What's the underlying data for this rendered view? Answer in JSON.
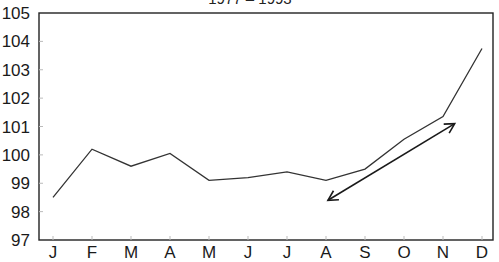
{
  "chart_data": {
    "type": "line",
    "title": "1977 – 1993",
    "xlabel": "",
    "ylabel": "",
    "categories": [
      "J",
      "F",
      "M",
      "A",
      "M",
      "J",
      "J",
      "A",
      "S",
      "O",
      "N",
      "D"
    ],
    "series": [
      {
        "name": "Index",
        "values": [
          98.5,
          100.2,
          99.6,
          100.05,
          99.1,
          99.2,
          99.4,
          99.1,
          99.5,
          100.55,
          101.35,
          103.75
        ],
        "color": "#333333"
      }
    ],
    "ylim": [
      97,
      105
    ],
    "yticks": [
      97,
      98,
      99,
      100,
      101,
      102,
      103,
      104,
      105
    ],
    "grid": false,
    "legend": "none",
    "annotations": [
      {
        "type": "double-arrow",
        "from": {
          "x": 7.05,
          "y": 98.4
        },
        "to": {
          "x": 10.3,
          "y": 101.1
        },
        "color": "#1a1a1a"
      }
    ]
  }
}
